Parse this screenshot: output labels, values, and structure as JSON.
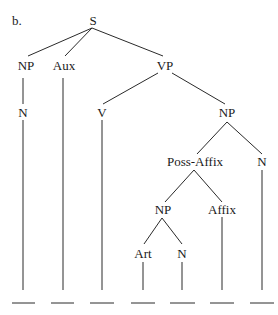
{
  "figure": {
    "label": "b.",
    "nodes": {
      "S": "S",
      "NP1": "NP",
      "Aux": "Aux",
      "VP": "VP",
      "N1": "N",
      "V": "V",
      "NP2": "NP",
      "PossAffix": "Poss-Affix",
      "N2": "N",
      "NP3": "NP",
      "Affix": "Affix",
      "Art": "Art",
      "N3": "N"
    },
    "terminals": [
      "",
      "",
      "",
      "",
      "",
      "",
      ""
    ]
  }
}
